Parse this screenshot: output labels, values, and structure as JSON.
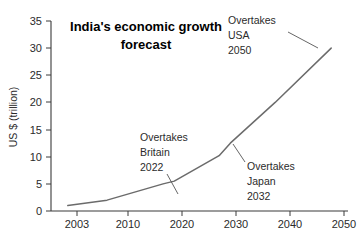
{
  "chart_data": {
    "type": "line",
    "title_line1": "India's economic growth",
    "title_line2": "forecast",
    "xlabel": "",
    "ylabel": "US $ (trillion)",
    "x": [
      2003,
      2010,
      2020,
      2022,
      2030,
      2032,
      2040,
      2050
    ],
    "values": [
      1.0,
      2.0,
      5.0,
      5.5,
      10.2,
      12.5,
      20.0,
      30.0
    ],
    "series": [
      {
        "name": "India GDP forecast",
        "values": [
          1.0,
          2.0,
          5.0,
          5.5,
          10.2,
          12.5,
          20.0,
          30.0
        ],
        "color": "#6b6b6b"
      }
    ],
    "xlim": [
      2000,
      2053
    ],
    "ylim": [
      0,
      35
    ],
    "xticks": [
      2003,
      2010,
      2020,
      2030,
      2040,
      2050
    ],
    "xtick_labels": [
      "2003",
      "2010",
      "2020",
      "2030",
      "2040",
      "2050"
    ],
    "yticks": [
      0,
      5,
      10,
      15,
      20,
      25,
      30,
      35
    ],
    "ytick_labels": [
      "0",
      "5",
      "10",
      "15",
      "20",
      "25",
      "30",
      "35"
    ],
    "grid": false,
    "legend": "none",
    "annotations": [
      {
        "id": "britain",
        "line1": "Overtakes",
        "line2": "Britain",
        "line3": "2022",
        "target_year": 2022,
        "target_value": 5.5
      },
      {
        "id": "japan",
        "line1": "Overtakes",
        "line2": "Japan",
        "line3": "2032",
        "target_year": 2032,
        "target_value": 12.5
      },
      {
        "id": "usa",
        "line1": "Overtakes",
        "line2": "USA",
        "line3": "2050",
        "target_year": 2050,
        "target_value": 30.0
      }
    ]
  },
  "colors": {
    "line": "#6b6b6b",
    "axis": "#3a3a3a",
    "text": "#2b2b2b",
    "background": "#ffffff"
  }
}
